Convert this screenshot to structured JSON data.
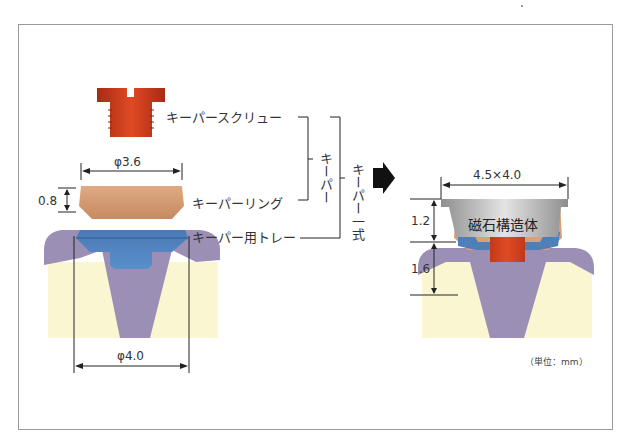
{
  "diagram": {
    "type": "dental keeper (magnetic attachment) assembly diagram",
    "left_parts": {
      "screw_label": "キーパースクリュー",
      "ring_label": "キーパーリング",
      "tray_label": "キーパー用トレー"
    },
    "groups": {
      "keeper_label": "キーパー",
      "keeper_set_label": "キーパー一式"
    },
    "dimensions": {
      "ring_diameter": "φ3.6",
      "ring_height": "0.8",
      "tray_diameter": "φ4.0",
      "magnet_size": "4.5×4.0",
      "magnet_height": "1.2",
      "keeper_height": "1.6"
    },
    "assembled": {
      "magnet_label": "磁石構造体"
    },
    "unit_note": "（単位：mm）",
    "colors": {
      "screw": "#c8391c",
      "ring": "#d69a72",
      "tray": "#4f7fb8",
      "tooth_root": "#9b8fb5",
      "dentin": "#faf6d2",
      "magnet": "#b8b8b8",
      "arrow": "#111111"
    }
  }
}
